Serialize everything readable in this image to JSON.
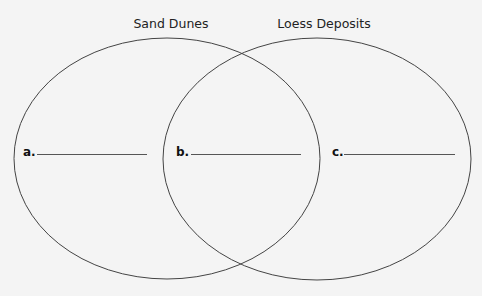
{
  "diagram": {
    "type": "venn",
    "sets": [
      {
        "title": "Sand Dunes"
      },
      {
        "title": "Loess Deposits"
      }
    ],
    "regions": [
      {
        "label": "a.",
        "answer": ""
      },
      {
        "label": "b.",
        "answer": ""
      },
      {
        "label": "c.",
        "answer": ""
      }
    ],
    "colors": {
      "background": "#f4f4f4",
      "stroke": "#444444",
      "text": "#222222"
    }
  }
}
